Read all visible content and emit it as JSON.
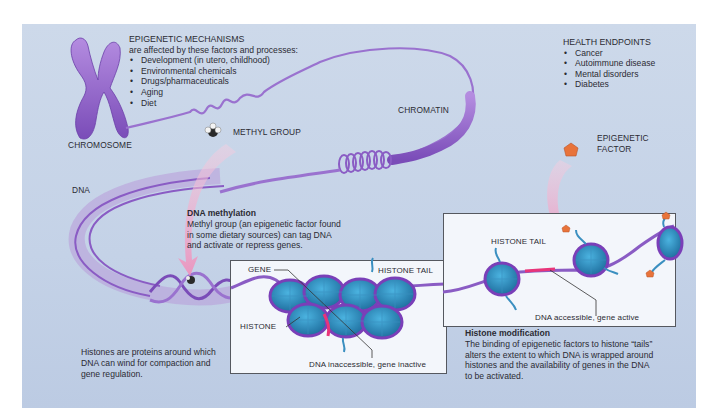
{
  "diagram": {
    "title": "Epigenetic mechanisms",
    "colors": {
      "background_panel": "#c6d4e8",
      "dna_purple": "#8a5cc4",
      "histone_blue": "#2f8fc0",
      "arrow_pink": "#eeaacb",
      "gene_highlight": "#e8357a",
      "epigenetic_factor": "#e8733a"
    },
    "mechanisms": {
      "heading": "EPIGENETIC MECHANISMS",
      "subheading": "are affected by these factors and processes:",
      "items": [
        "Development (in utero, childhood)",
        "Environmental chemicals",
        "Drugs/pharmaceuticals",
        "Aging",
        "Diet"
      ]
    },
    "health": {
      "heading": "HEALTH ENDPOINTS",
      "items": [
        "Cancer",
        "Autoimmune disease",
        "Mental disorders",
        "Diabetes"
      ]
    },
    "labels": {
      "chromosome": "CHROMOSOME",
      "chromatin": "CHROMATIN",
      "methyl_group": "METHYL GROUP",
      "dna": "DNA",
      "epigenetic_factor_1": "EPIGENETIC",
      "epigenetic_factor_2": "FACTOR",
      "gene": "GENE",
      "histone_tail_inactive": "HISTONE TAIL",
      "histone": "HISTONE",
      "histone_tail_active": "HISTONE TAIL",
      "inactive_caption": "DNA inaccessible, gene inactive",
      "active_caption": "DNA accessible, gene active"
    },
    "methylation": {
      "title": "DNA methylation",
      "lines": [
        "Methyl group (an epigenetic factor found",
        "in some dietary sources) can tag DNA",
        "and activate or repress genes."
      ]
    },
    "histones_note": {
      "lines": [
        "Histones are proteins around which",
        "DNA can wind for compaction and",
        "gene regulation."
      ]
    },
    "histone_modification": {
      "title": "Histone modification",
      "lines": [
        "The binding of epigenetic factors to histone “tails”",
        "alters the extent to which DNA is wrapped around",
        "histones and the availability of genes in the DNA",
        "to be activated."
      ]
    }
  }
}
